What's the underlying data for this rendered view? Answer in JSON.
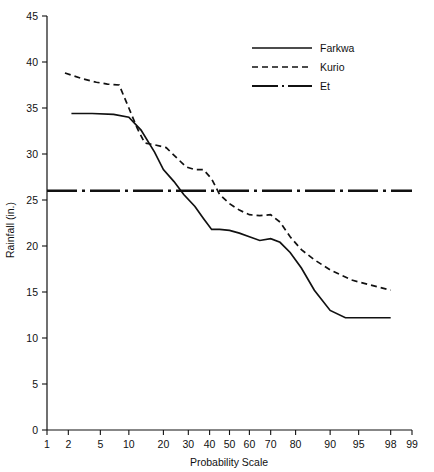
{
  "chart_data": {
    "type": "line",
    "title": "",
    "xlabel": "Probability Scale",
    "ylabel": "Rainfall (in.)",
    "xticks": [
      1,
      2,
      5,
      10,
      20,
      30,
      40,
      50,
      60,
      70,
      80,
      90,
      95,
      98,
      99
    ],
    "xtick_labels": [
      "1",
      "2",
      "5",
      "10",
      "20",
      "30",
      "40",
      "50",
      "60",
      "70",
      "80",
      "90",
      "95",
      "98",
      "99"
    ],
    "yticks": [
      0,
      5,
      10,
      15,
      20,
      25,
      30,
      35,
      40,
      45
    ],
    "ytick_labels": [
      "0",
      "5",
      "10",
      "15",
      "20",
      "25",
      "30",
      "35",
      "40",
      "45"
    ],
    "ylim": [
      0,
      45
    ],
    "xlim": [
      1,
      99
    ],
    "xscale": "probability",
    "grid": false,
    "legend_position": "top-center-right",
    "series": [
      {
        "name": "Farkwa",
        "style": "solid",
        "color": "#111111",
        "x": [
          2.2,
          4.0,
          7.0,
          10.0,
          13.0,
          17.0,
          20.0,
          24.0,
          28.0,
          33.0,
          37.0,
          41.0,
          45.0,
          50.0,
          55.0,
          60.0,
          65.0,
          70.0,
          74.0,
          78.0,
          82.0,
          86.0,
          90.0,
          93.0,
          96.0,
          98.0
        ],
        "y": [
          34.4,
          34.4,
          34.3,
          34.0,
          32.6,
          30.2,
          28.3,
          27.0,
          25.6,
          24.3,
          23.0,
          21.8,
          21.8,
          21.7,
          21.4,
          21.0,
          20.6,
          20.8,
          20.4,
          19.3,
          17.6,
          15.2,
          13.0,
          12.2,
          12.2,
          12.2
        ]
      },
      {
        "name": "Kurio",
        "style": "dashed",
        "color": "#111111",
        "x": [
          1.8,
          3.0,
          4.5,
          6.0,
          8.0,
          10.0,
          12.0,
          14.0,
          17.0,
          21.0,
          25.0,
          29.0,
          33.0,
          37.0,
          41.0,
          45.0,
          50.0,
          55.0,
          60.0,
          65.0,
          70.0,
          74.0,
          78.0,
          82.0,
          86.0,
          90.0,
          94.0,
          98.0
        ],
        "y": [
          38.8,
          38.2,
          37.8,
          37.6,
          37.5,
          35.0,
          32.8,
          31.2,
          31.0,
          30.7,
          29.6,
          28.6,
          28.3,
          28.3,
          27.3,
          25.6,
          24.6,
          23.9,
          23.4,
          23.3,
          23.4,
          22.6,
          21.0,
          19.6,
          18.5,
          17.4,
          16.3,
          15.2
        ]
      },
      {
        "name": "Et",
        "style": "dash-dot",
        "color": "#111111",
        "x": [
          1,
          99
        ],
        "y": [
          26.0,
          26.0
        ],
        "note": "constant evapotranspiration reference line"
      }
    ]
  },
  "legend": {
    "entries": [
      {
        "label": "Farkwa",
        "style": "solid"
      },
      {
        "label": "Kurio",
        "style": "dashed"
      },
      {
        "label": "Et",
        "style": "dash-dot"
      }
    ]
  }
}
